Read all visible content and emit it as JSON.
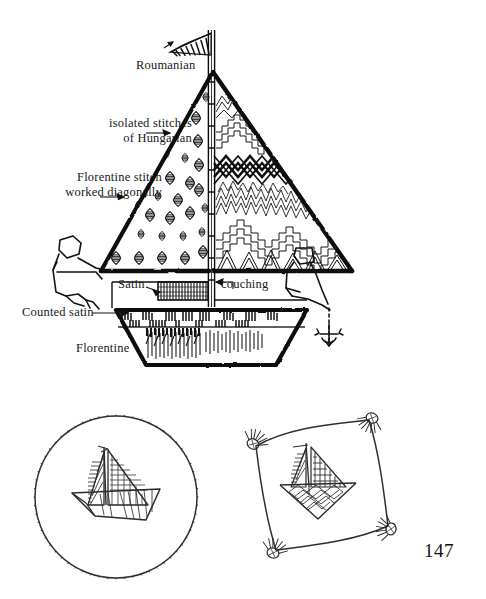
{
  "page": {
    "number": "147",
    "background_color": "#ffffff",
    "ink_color": "#111111"
  },
  "figure_top": {
    "name": "sailboat-stitch-diagram",
    "description": "Line drawing of a sailboat whose sails and hull are filled with different counted-thread embroidery stitches; two stick figures sit on the deck.",
    "labels": [
      {
        "id": "roumanian",
        "text": "Roumanian",
        "target": "pennant-at-masthead"
      },
      {
        "id": "isolated",
        "text": "isolated stitches\nof Hungarian",
        "target": "foresail-diamond-motifs"
      },
      {
        "id": "florentine_diag",
        "text": "Florentine stitch\nworked diagonally",
        "target": "foresail-lower-left"
      },
      {
        "id": "satin",
        "text": "Satin",
        "target": "cabin-block"
      },
      {
        "id": "couching",
        "text": "couching",
        "target": "deck-band"
      },
      {
        "id": "counted_satin",
        "text": "Counted satin",
        "target": "upper-hull-band"
      },
      {
        "id": "florentine",
        "text": "Florentine",
        "target": "lower-hull"
      }
    ],
    "label_lines": {
      "roumanian": "Roumanian",
      "isolated_l1": "isolated stitches",
      "isolated_l2": "of Hungarian",
      "florentine_diag_l1": "Florentine stitch",
      "florentine_diag_l2": "worked diagonally",
      "satin": "Satin",
      "couching": "couching",
      "counted_satin": "Counted satin",
      "florentine": "Florentine"
    }
  },
  "figure_bottom_left": {
    "name": "round-embroidered-sailboat-sample",
    "description": "Circular finished piece: a shaded sailboat stitched at centre, ringed by a dense looped fringe edging."
  },
  "figure_bottom_right": {
    "name": "square-embroidered-sailboat-sample",
    "description": "Square finished piece with concave sides, a sailboat stitched at centre and a tassel at each of the four corners."
  }
}
